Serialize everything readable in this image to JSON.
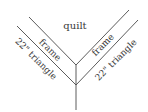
{
  "diagram": {
    "labels": {
      "center": "quilt",
      "left_inner": "frame",
      "left_outer": "22\" triangle",
      "right_inner": "frame",
      "right_outer": "22\" triangle"
    },
    "line_color": "#4a4a4a",
    "text_color": "#3a3a3a"
  }
}
